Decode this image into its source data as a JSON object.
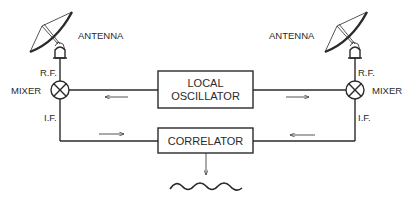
{
  "diagram": {
    "left": {
      "antenna_label": "ANTENNA",
      "rf_label": "R.F.",
      "mixer_label": "MIXER",
      "if_label": "I.F."
    },
    "right": {
      "antenna_label": "ANTENNA",
      "rf_label": "R.F.",
      "mixer_label": "MIXER",
      "if_label": "I.F."
    },
    "local_oscillator": {
      "line1": "LOCAL",
      "line2": "OSCILLATOR"
    },
    "correlator": {
      "label": "CORRELATOR"
    },
    "arrows": {
      "lo_to_left_mixer": "left",
      "lo_to_right_mixer": "right",
      "left_if_to_correlator": "right",
      "right_if_to_correlator": "left",
      "correlator_output": "down"
    },
    "output": "sinusoidal fringe waveform",
    "colors": {
      "ink": "#2a2a2a",
      "background": "#ffffff"
    }
  }
}
